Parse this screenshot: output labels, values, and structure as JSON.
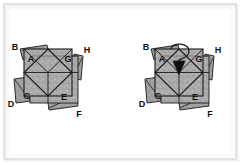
{
  "figure": {
    "background_color": "#ffffff",
    "frame": {
      "outer_border_color": "#d8d8d8",
      "inner_border_color": "#eeeeee",
      "shadow_color": "#e4e4e4"
    },
    "style": {
      "stroke_color": "#1a1a1a",
      "panel_fill": "#a8a8a8",
      "panel_fill_light": "#bdbdbd",
      "panel_fill_dark": "#8f8f8f",
      "flap_fill": "#9c9c9c",
      "texture": "speckled-gray",
      "label_color": "#111111"
    },
    "panels": [
      {
        "name": "left-panel",
        "caption": "",
        "has_arrow": false,
        "labels": [
          {
            "id": "B",
            "text": "B",
            "x": 16,
            "y": 48
          },
          {
            "id": "A",
            "text": "A",
            "x": 31,
            "y": 62
          },
          {
            "id": "G",
            "text": "G",
            "x": 67,
            "y": 62
          },
          {
            "id": "H",
            "text": "H",
            "x": 87,
            "y": 52
          },
          {
            "id": "C",
            "text": "C",
            "x": 26,
            "y": 98
          },
          {
            "id": "D",
            "text": "D",
            "x": 9,
            "y": 105
          },
          {
            "id": "E",
            "text": "E",
            "x": 63,
            "y": 99
          },
          {
            "id": "F",
            "text": "F",
            "x": 79,
            "y": 116
          }
        ]
      },
      {
        "name": "right-panel",
        "caption": "",
        "has_arrow": true,
        "arrow": {
          "name": "fold-direction-arrow",
          "description": "curved arrow pointing down into center",
          "color": "#111111"
        },
        "labels": [
          {
            "id": "B",
            "text": "B",
            "x": 147,
            "y": 48
          },
          {
            "id": "A",
            "text": "A",
            "x": 162,
            "y": 62
          },
          {
            "id": "G",
            "text": "G",
            "x": 198,
            "y": 62
          },
          {
            "id": "H",
            "text": "H",
            "x": 218,
            "y": 52
          },
          {
            "id": "C",
            "text": "C",
            "x": 157,
            "y": 98
          },
          {
            "id": "D",
            "text": "D",
            "x": 140,
            "y": 105
          },
          {
            "id": "E",
            "text": "E",
            "x": 194,
            "y": 99
          },
          {
            "id": "F",
            "text": "F",
            "x": 210,
            "y": 116
          }
        ]
      }
    ]
  }
}
